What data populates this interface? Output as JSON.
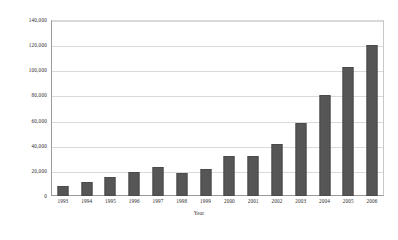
{
  "chart_data": {
    "type": "bar",
    "title": "",
    "xlabel": "Year",
    "ylabel": "Million US Dollars",
    "categories": [
      "1993",
      "1994",
      "1995",
      "1996",
      "1997",
      "1998",
      "1999",
      "2000",
      "2001",
      "2002",
      "2003",
      "2004",
      "2005",
      "2006"
    ],
    "values": [
      8000,
      11500,
      15500,
      19500,
      23000,
      18500,
      21500,
      32000,
      32000,
      41000,
      58000,
      80000,
      103000,
      120000
    ],
    "ylim": [
      0,
      140000
    ],
    "ytick_values": [
      0,
      20000,
      40000,
      60000,
      80000,
      100000,
      120000,
      140000
    ],
    "ytick_labels": [
      "0",
      "20,000",
      "40,000",
      "60,000",
      "80,000",
      "100,000",
      "120,000",
      "140,000"
    ],
    "grid": true,
    "legend": null,
    "series_color": "#565656",
    "grid_color": "#dadada",
    "axis_color": "#9a9a9a"
  }
}
